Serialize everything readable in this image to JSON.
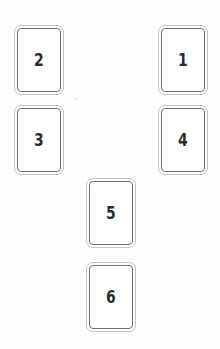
{
  "canvas": {
    "width": 220,
    "height": 349,
    "background": "#fdfdfd"
  },
  "style": {
    "card_fill": "#ffffff",
    "card_outer_border": "#c3c3c3",
    "card_inner_border": "#6f6f6f",
    "digit_color": "#2b2b2b"
  },
  "cards": [
    {
      "id": "card-2",
      "label": "2",
      "x": 14,
      "y": 25,
      "column": "left",
      "row": 1
    },
    {
      "id": "card-1",
      "label": "1",
      "x": 158,
      "y": 25,
      "column": "right",
      "row": 1
    },
    {
      "id": "card-3",
      "label": "3",
      "x": 14,
      "y": 105,
      "column": "left",
      "row": 2
    },
    {
      "id": "card-4",
      "label": "4",
      "x": 158,
      "y": 105,
      "column": "right",
      "row": 2
    },
    {
      "id": "card-5",
      "label": "5",
      "x": 86,
      "y": 178,
      "column": "center",
      "row": 3
    },
    {
      "id": "card-6",
      "label": "6",
      "x": 86,
      "y": 262,
      "column": "center",
      "row": 4
    }
  ],
  "artifacts": [
    {
      "id": "speck-1",
      "x": 74,
      "y": 98
    }
  ]
}
